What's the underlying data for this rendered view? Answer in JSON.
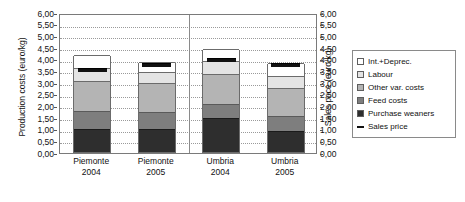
{
  "chart_data": {
    "type": "bar",
    "subtype": "stacked-bar-with-line-markers",
    "title": "",
    "xlabel": "",
    "ylabel": "Production costs (euro/kg)",
    "ylabel_secondary": "Sales price (euro/kg)",
    "categories": [
      "Piemonte 2004",
      "Piemonte 2005",
      "Umbria 2004",
      "Umbria 2005"
    ],
    "category_lines": [
      {
        "line1": "Piemonte",
        "line2": "2004"
      },
      {
        "line1": "Piemonte",
        "line2": "2005"
      },
      {
        "line1": "Umbria",
        "line2": "2004"
      },
      {
        "line1": "Umbria",
        "line2": "2005"
      }
    ],
    "ylim": [
      0,
      6
    ],
    "ylim_secondary": [
      0,
      6
    ],
    "ytick_labels": [
      "6,00",
      "5,50",
      "5,00",
      "4,50",
      "4,00",
      "3,50",
      "3,00",
      "2,50",
      "2,00",
      "1,50",
      "1,00",
      "0,50",
      "0,00"
    ],
    "ytick_values": [
      6.0,
      5.5,
      5.0,
      4.5,
      4.0,
      3.5,
      3.0,
      2.5,
      2.0,
      1.5,
      1.0,
      0.5,
      0.0
    ],
    "ytick_labels_secondary": [
      "6,00",
      "5,50",
      "5,00",
      "4,50",
      "4,00",
      "3,50",
      "3,00",
      "2,50",
      "2,00",
      "1,50",
      "1,00",
      "0,50",
      "0,00"
    ],
    "grid": true,
    "grid_style": "dotted-horizontal",
    "legend_position": "right",
    "stack_order_bottom_to_top": [
      "Purchase weaners",
      "Feed costs",
      "Other var. costs",
      "Labour",
      "Int.+Deprec."
    ],
    "series": [
      {
        "name": "Purchase weaners",
        "color": "#2e2e2e",
        "values": [
          1.0,
          1.0,
          1.45,
          0.9
        ]
      },
      {
        "name": "Feed costs",
        "color": "#7e7e7e",
        "values": [
          0.75,
          0.7,
          0.6,
          0.65
        ]
      },
      {
        "name": "Other var. costs",
        "color": "#b4b4b4",
        "values": [
          1.3,
          1.25,
          1.3,
          1.2
        ]
      },
      {
        "name": "Labour",
        "color": "#e4e4e4",
        "values": [
          0.55,
          0.5,
          0.55,
          0.5
        ]
      },
      {
        "name": "Int.+Deprec.",
        "color": "#ffffff",
        "values": [
          0.55,
          0.4,
          0.5,
          0.55
        ]
      }
    ],
    "totals": [
      4.15,
      3.85,
      4.4,
      3.8
    ],
    "line_series": {
      "name": "Sales price",
      "color": "#111111",
      "values": [
        3.5,
        3.75,
        3.95,
        3.75
      ]
    },
    "legend": [
      {
        "label": "Int.+Deprec.",
        "swatch": "#ffffff",
        "kind": "box"
      },
      {
        "label": "Labour",
        "swatch": "#e4e4e4",
        "kind": "box"
      },
      {
        "label": "Other var. costs",
        "swatch": "#b4b4b4",
        "kind": "box"
      },
      {
        "label": "Feed costs",
        "swatch": "#7e7e7e",
        "kind": "box"
      },
      {
        "label": "Purchase weaners",
        "swatch": "#2e2e2e",
        "kind": "box"
      },
      {
        "label": "Sales price",
        "swatch": "#111111",
        "kind": "line"
      }
    ]
  }
}
